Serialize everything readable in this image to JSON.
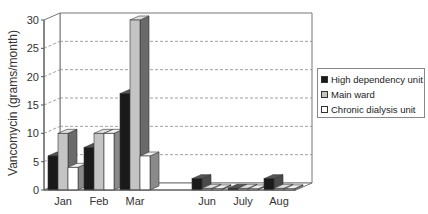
{
  "chart_data": {
    "type": "bar",
    "style": "3d-clustered-column",
    "title": "",
    "xlabel": "",
    "ylabel": "Vancomycin (grams/month)",
    "ylim": [
      0,
      30
    ],
    "yticks": [
      0,
      5,
      10,
      15,
      20,
      25,
      30
    ],
    "grid": "dashed horizontal",
    "legend_position": "right",
    "categories": [
      "Jan",
      "Feb",
      "Mar",
      "",
      "Jun",
      "July",
      "Aug"
    ],
    "series": [
      {
        "name": "High dependency unit",
        "color": "#1a1a1a",
        "values": [
          6,
          7.5,
          17,
          0,
          2,
          0.3,
          2
        ]
      },
      {
        "name": "Main ward",
        "color": "#c4c4c4",
        "values": [
          10,
          10,
          30,
          0,
          0.3,
          0.3,
          0.3
        ]
      },
      {
        "name": "Chronic dialysis unit",
        "color": "#ffffff",
        "values": [
          4,
          10,
          6,
          0,
          0.2,
          0.2,
          0.2
        ]
      }
    ]
  },
  "legend": {
    "items": [
      {
        "label": "High dependency unit",
        "color": "#1a1a1a"
      },
      {
        "label": "Main ward",
        "color": "#c4c4c4"
      },
      {
        "label": "Chronic dialysis unit",
        "color": "#ffffff"
      }
    ]
  },
  "axis": {
    "ylabel": "Vancomycin (grams/month)"
  }
}
